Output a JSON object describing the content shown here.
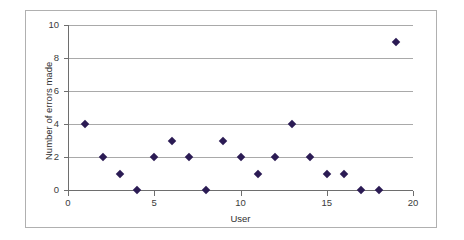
{
  "chart_data": {
    "type": "scatter",
    "title": "",
    "xlabel": "User",
    "ylabel": "Number of errors made",
    "xlim": [
      0,
      20
    ],
    "ylim": [
      0,
      10
    ],
    "xticks": [
      0,
      5,
      10,
      15,
      20
    ],
    "yticks": [
      0,
      2,
      4,
      6,
      8,
      10
    ],
    "grid": "horizontal",
    "legend": "none",
    "marker": "diamond",
    "marker_color": "#2B1B54",
    "x": [
      1,
      2,
      3,
      4,
      5,
      6,
      7,
      8,
      9,
      10,
      11,
      12,
      13,
      14,
      15,
      16,
      17,
      18,
      19
    ],
    "values": [
      4,
      2,
      1,
      0,
      2,
      3,
      2,
      0,
      3,
      2,
      1,
      2,
      4,
      2,
      1,
      1,
      0,
      0,
      9
    ],
    "series": [
      {
        "name": "Errors",
        "x": [
          1,
          2,
          3,
          4,
          5,
          6,
          7,
          8,
          9,
          10,
          11,
          12,
          13,
          14,
          15,
          16,
          17,
          18,
          19
        ],
        "values": [
          4,
          2,
          1,
          0,
          2,
          3,
          2,
          0,
          3,
          2,
          1,
          2,
          4,
          2,
          1,
          1,
          0,
          0,
          9
        ]
      }
    ]
  },
  "axis": {
    "xtick_labels": [
      "0",
      "5",
      "10",
      "15",
      "20"
    ],
    "ytick_labels": [
      "0",
      "2",
      "4",
      "6",
      "8",
      "10"
    ],
    "x_title": "User",
    "y_title": "Number of errors made"
  },
  "colors": {
    "marker": "#2B1B54",
    "gridline": "#A9A9A9",
    "axis": "#6E6E6E",
    "frame": "#B0B0B0",
    "background": "#FFFFFF"
  }
}
